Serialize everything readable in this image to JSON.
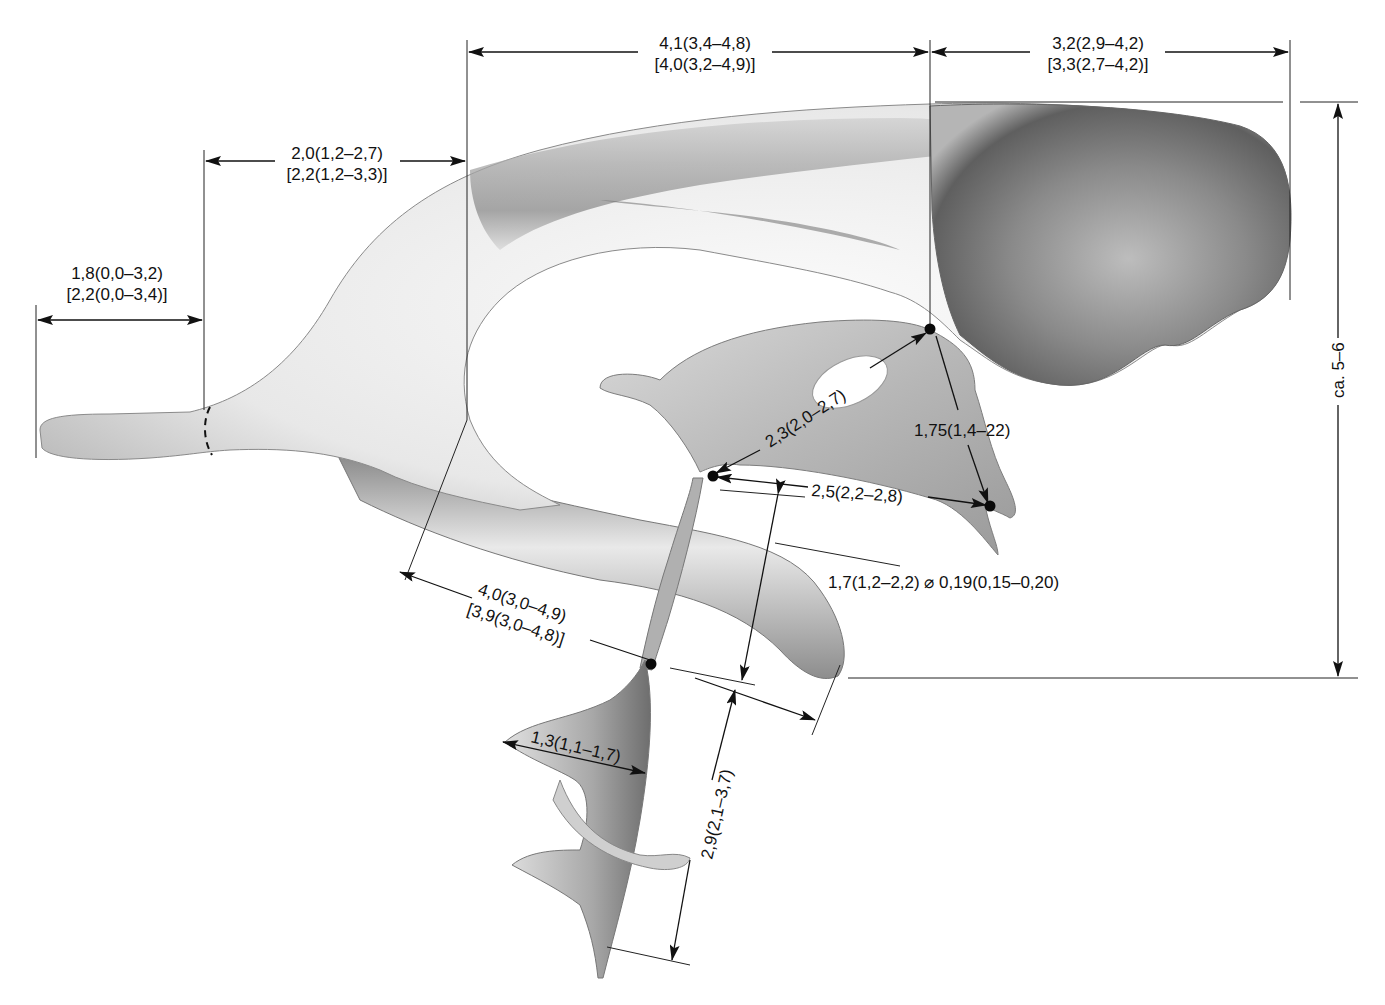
{
  "figure": {
    "colors": {
      "background": "#ffffff",
      "cast_light": "#f1f1f1",
      "cast_mid": "#bdbdbd",
      "cast_dark": "#6b6b6b",
      "line": "#111111"
    },
    "measurements": {
      "frontal_horn_top": {
        "line1": "4,1(3,4–4,8)",
        "line2": "[4,0(3,2–4,9)]"
      },
      "occipital_top": {
        "line1": "3,2(2,9–4,2)",
        "line2": "[3,3(2,7–4,2)]"
      },
      "central_part": {
        "line1": "2,0(1,2–2,7)",
        "line2": "[2,2(1,2–3,3)]"
      },
      "occipital_horn": {
        "line1": "1,8(0,0–3,2)",
        "line2": "[2,2(0,0–3,4)]"
      },
      "third_ventricle_diag": {
        "text": "2,3(2,0–2,7)"
      },
      "third_ventricle_vert": {
        "text": "1,75(1,4–22)"
      },
      "third_ventricle_horiz": {
        "text": "2,5(2,2–2,8)"
      },
      "aqueduct": {
        "text": "1,7(1,2–2,2) ⌀ 0,19(0,15–0,20)"
      },
      "temporal_horn": {
        "line1": "4,0(3,0–4,9)",
        "line2": "[3,9(3,0–4,8)]"
      },
      "fourth_ventricle_width": {
        "text": "1,3(1,1–1,7)"
      },
      "fourth_ventricle_height": {
        "text": "2,9(2,1–3,7)"
      },
      "total_height": {
        "text": "ca. 5–6"
      }
    }
  }
}
